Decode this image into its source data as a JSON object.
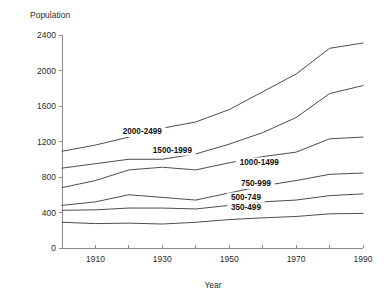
{
  "chart_data": {
    "type": "line",
    "title": "",
    "xlabel": "Year",
    "ylabel": "Population",
    "xlim": [
      1900,
      1990
    ],
    "ylim": [
      0,
      2400
    ],
    "grid": false,
    "legend_position": "inline-labels",
    "x": [
      1900,
      1910,
      1920,
      1930,
      1940,
      1950,
      1960,
      1970,
      1980,
      1990
    ],
    "x_tick_labels": [
      "1910",
      "1930",
      "1950",
      "1970",
      "1990"
    ],
    "x_tick_values": [
      1910,
      1930,
      1950,
      1970,
      1990
    ],
    "x_minor_ticks": [
      1900,
      1920,
      1940,
      1960,
      1980
    ],
    "y_tick_labels": [
      "0",
      "400",
      "800",
      "1200",
      "1600",
      "2000",
      "2400"
    ],
    "y_tick_values": [
      0,
      400,
      800,
      1200,
      1600,
      2000,
      2400
    ],
    "series": [
      {
        "name": "2000-2499",
        "label": "2000-2499",
        "label_x": 1924,
        "label_y": 1285,
        "values": [
          1090,
          1160,
          1250,
          1350,
          1420,
          1560,
          1760,
          1960,
          2250,
          2310
        ]
      },
      {
        "name": "1500-1999",
        "label": "1500-1999",
        "label_x": 1933,
        "label_y": 1075,
        "values": [
          900,
          950,
          1000,
          1000,
          1060,
          1170,
          1300,
          1470,
          1740,
          1830
        ]
      },
      {
        "name": "1000-1499",
        "label": "1000-1499",
        "label_x": 1959,
        "label_y": 940,
        "values": [
          680,
          760,
          880,
          910,
          880,
          960,
          1030,
          1080,
          1230,
          1250
        ]
      },
      {
        "name": "750-999",
        "label": "750-999",
        "label_x": 1958,
        "label_y": 700,
        "values": [
          480,
          520,
          600,
          570,
          540,
          620,
          700,
          760,
          830,
          845
        ]
      },
      {
        "name": "500-749",
        "label": "500-749",
        "label_x": 1955,
        "label_y": 545,
        "values": [
          425,
          430,
          450,
          450,
          440,
          480,
          520,
          540,
          590,
          610
        ]
      },
      {
        "name": "350-499",
        "label": "350-499",
        "label_x": 1955,
        "label_y": 430,
        "values": [
          290,
          275,
          280,
          270,
          290,
          320,
          340,
          355,
          385,
          390
        ]
      }
    ]
  },
  "axes": {
    "y_axis_title": "Population",
    "x_axis_title": "Year"
  }
}
